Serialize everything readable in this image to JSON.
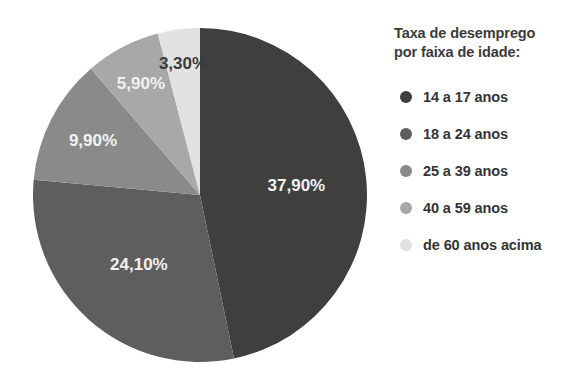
{
  "legend": {
    "title": "Taxa de desemprego\npor faixa de idade:",
    "items": [
      {
        "label": "14 a 17 anos",
        "color": "#3f3f3f"
      },
      {
        "label": "18 a 24 anos",
        "color": "#5e5e5e"
      },
      {
        "label": "25 a 39 anos",
        "color": "#8a8a8a"
      },
      {
        "label": "40 a 59 anos",
        "color": "#a8a8a8"
      },
      {
        "label": "de 60 anos acima",
        "color": "#e2e2e2"
      }
    ]
  },
  "chart_data": {
    "type": "pie",
    "title": "Taxa de desemprego por faixa de idade:",
    "xlabel": "",
    "ylabel": "",
    "legend_position": "right",
    "grid": false,
    "start_angle_deg": 0,
    "direction": "clockwise",
    "categories": [
      "14 a 17 anos",
      "18 a 24 anos",
      "25 a 39 anos",
      "40 a 59 anos",
      "de 60 anos acima"
    ],
    "values": [
      37.9,
      24.1,
      9.9,
      5.9,
      3.3
    ],
    "labels": [
      "37,90%",
      "24,10%",
      "9,90%",
      "5,90%",
      "3,30%"
    ],
    "colors": [
      "#3f3f3f",
      "#5e5e5e",
      "#8a8a8a",
      "#a8a8a8",
      "#e2e2e2"
    ],
    "label_text_colors": [
      "#f2f2f2",
      "#f2f2f2",
      "#f2f2f2",
      "#f2f2f2",
      "#3a3a3a"
    ],
    "total": 81.1
  }
}
